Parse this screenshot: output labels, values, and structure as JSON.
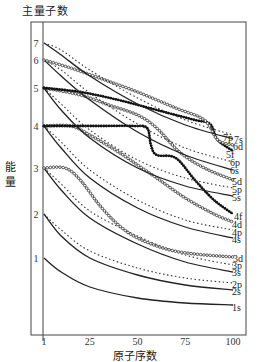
{
  "chart_data": {
    "type": "line",
    "title": "主量子数",
    "xlabel": "原子序数",
    "ylabel": "能量",
    "xlim": [
      1,
      100
    ],
    "x_ticks": [
      "1",
      "25",
      "50",
      "75",
      "100"
    ],
    "y_level_labels": [
      "1",
      "2",
      "3",
      "4",
      "5",
      "6",
      "7"
    ],
    "grid": false,
    "legend": "inline labels at right end of curves",
    "series_styles": {
      "s": "solid",
      "p": "dotted",
      "d": "open-circle markers",
      "f": "filled-dot markers"
    },
    "series": [
      {
        "name": "1s",
        "style": "solid",
        "points": [
          [
            1,
            258
          ],
          [
            10,
            272
          ],
          [
            25,
            287
          ],
          [
            50,
            298
          ],
          [
            75,
            303
          ],
          [
            100,
            305
          ]
        ]
      },
      {
        "name": "2s",
        "style": "solid",
        "points": [
          [
            1,
            214
          ],
          [
            10,
            236
          ],
          [
            25,
            258
          ],
          [
            50,
            275
          ],
          [
            75,
            285
          ],
          [
            100,
            290
          ]
        ]
      },
      {
        "name": "2p",
        "style": "dotted",
        "points": [
          [
            1,
            214
          ],
          [
            10,
            230
          ],
          [
            25,
            251
          ],
          [
            50,
            268
          ],
          [
            75,
            278
          ],
          [
            100,
            283
          ]
        ]
      },
      {
        "name": "3s",
        "style": "solid",
        "points": [
          [
            1,
            168
          ],
          [
            10,
            190
          ],
          [
            25,
            218
          ],
          [
            50,
            244
          ],
          [
            75,
            262
          ],
          [
            100,
            272
          ]
        ]
      },
      {
        "name": "3p",
        "style": "dotted",
        "points": [
          [
            1,
            168
          ],
          [
            10,
            184
          ],
          [
            25,
            211
          ],
          [
            50,
            236
          ],
          [
            75,
            255
          ],
          [
            100,
            265
          ]
        ]
      },
      {
        "name": "3d",
        "style": "circles",
        "points": [
          [
            1,
            168
          ],
          [
            12,
            168
          ],
          [
            20,
            180
          ],
          [
            30,
            205
          ],
          [
            40,
            225
          ],
          [
            50,
            238
          ],
          [
            65,
            249
          ],
          [
            80,
            254
          ],
          [
            100,
            257
          ]
        ]
      },
      {
        "name": "4s",
        "style": "solid",
        "points": [
          [
            1,
            126
          ],
          [
            10,
            148
          ],
          [
            25,
            178
          ],
          [
            50,
            208
          ],
          [
            75,
            227
          ],
          [
            100,
            238
          ]
        ]
      },
      {
        "name": "4p",
        "style": "dotted",
        "points": [
          [
            1,
            126
          ],
          [
            10,
            142
          ],
          [
            25,
            170
          ],
          [
            50,
            200
          ],
          [
            75,
            220
          ],
          [
            100,
            230
          ]
        ]
      },
      {
        "name": "4d",
        "style": "circles",
        "points": [
          [
            1,
            126
          ],
          [
            15,
            126
          ],
          [
            25,
            135
          ],
          [
            40,
            152
          ],
          [
            50,
            165
          ],
          [
            60,
            178
          ],
          [
            75,
            198
          ],
          [
            90,
            214
          ],
          [
            100,
            222
          ]
        ]
      },
      {
        "name": "4f",
        "style": "dots",
        "points": [
          [
            1,
            126
          ],
          [
            30,
            126
          ],
          [
            48,
            126
          ],
          [
            55,
            128
          ],
          [
            57,
            145
          ],
          [
            60,
            155
          ],
          [
            70,
            158
          ],
          [
            80,
            180
          ],
          [
            90,
            200
          ],
          [
            100,
            214
          ]
        ]
      },
      {
        "name": "5s",
        "style": "solid",
        "points": [
          [
            1,
            88
          ],
          [
            10,
            110
          ],
          [
            25,
            138
          ],
          [
            50,
            168
          ],
          [
            75,
            186
          ],
          [
            100,
            196
          ]
        ]
      },
      {
        "name": "5p",
        "style": "dotted",
        "points": [
          [
            1,
            88
          ],
          [
            10,
            104
          ],
          [
            25,
            130
          ],
          [
            50,
            160
          ],
          [
            75,
            178
          ],
          [
            100,
            188
          ]
        ]
      },
      {
        "name": "5d",
        "style": "circles",
        "points": [
          [
            1,
            88
          ],
          [
            20,
            95
          ],
          [
            35,
            105
          ],
          [
            50,
            115
          ],
          [
            60,
            128
          ],
          [
            72,
            152
          ],
          [
            85,
            168
          ],
          [
            100,
            180
          ]
        ]
      },
      {
        "name": "5f",
        "style": "dots",
        "points": [
          [
            1,
            88
          ],
          [
            20,
            92
          ],
          [
            40,
            100
          ],
          [
            60,
            110
          ],
          [
            80,
            120
          ],
          [
            88,
            124
          ],
          [
            92,
            140
          ],
          [
            100,
            151
          ]
        ]
      },
      {
        "name": "6s",
        "style": "solid",
        "points": [
          [
            1,
            60
          ],
          [
            10,
            76
          ],
          [
            25,
            100
          ],
          [
            50,
            132
          ],
          [
            75,
            155
          ],
          [
            100,
            170
          ]
        ]
      },
      {
        "name": "6p",
        "style": "dotted",
        "points": [
          [
            1,
            60
          ],
          [
            10,
            70
          ],
          [
            25,
            93
          ],
          [
            50,
            124
          ],
          [
            75,
            148
          ],
          [
            100,
            162
          ]
        ]
      },
      {
        "name": "6d",
        "style": "circles",
        "points": [
          [
            1,
            60
          ],
          [
            15,
            68
          ],
          [
            30,
            78
          ],
          [
            50,
            92
          ],
          [
            70,
            108
          ],
          [
            85,
            120
          ],
          [
            92,
            140
          ],
          [
            100,
            145
          ]
        ]
      },
      {
        "name": "7s",
        "style": "solid",
        "points": [
          [
            1,
            43
          ],
          [
            10,
            55
          ],
          [
            25,
            76
          ],
          [
            50,
            104
          ],
          [
            75,
            125
          ],
          [
            100,
            139
          ]
        ]
      },
      {
        "name": "7p",
        "style": "dotted",
        "points": [
          [
            1,
            43
          ],
          [
            10,
            50
          ],
          [
            25,
            70
          ],
          [
            50,
            98
          ],
          [
            75,
            120
          ],
          [
            100,
            135
          ]
        ]
      }
    ],
    "right_labels": [
      {
        "text": "7p",
        "y": 138,
        "x": 223
      },
      {
        "text": "7s",
        "y": 140,
        "x": 234
      },
      {
        "text": "6d",
        "y": 147,
        "x": 233
      },
      {
        "text": "5f",
        "y": 155,
        "x": 226
      },
      {
        "text": "6p",
        "y": 163,
        "x": 230
      },
      {
        "text": "6s",
        "y": 171,
        "x": 230
      },
      {
        "text": "5d",
        "y": 182,
        "x": 232
      },
      {
        "text": "5p",
        "y": 190,
        "x": 232
      },
      {
        "text": "5s",
        "y": 198,
        "x": 232
      },
      {
        "text": "4f",
        "y": 217,
        "x": 234
      },
      {
        "text": "4d",
        "y": 225,
        "x": 232
      },
      {
        "text": "4p",
        "y": 233,
        "x": 232
      },
      {
        "text": "4s",
        "y": 240,
        "x": 232
      },
      {
        "text": "3d",
        "y": 259,
        "x": 233
      },
      {
        "text": "3p",
        "y": 266,
        "x": 232
      },
      {
        "text": "3s",
        "y": 273,
        "x": 232
      },
      {
        "text": "2p",
        "y": 285,
        "x": 232
      },
      {
        "text": "2s",
        "y": 292,
        "x": 232
      },
      {
        "text": "1s",
        "y": 308,
        "x": 232
      }
    ],
    "level_label_y": {
      "1": 258,
      "2": 214,
      "3": 168,
      "4": 126,
      "5": 88,
      "6": 60,
      "7": 43
    }
  },
  "labels": {
    "title": "主量子数",
    "ylabel": "能量",
    "xlabel": "原子序数"
  }
}
